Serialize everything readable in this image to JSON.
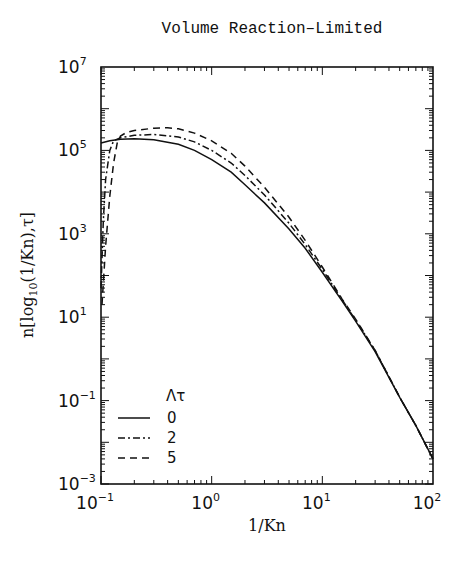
{
  "chart_data": {
    "type": "line",
    "title": "Volume Reaction–Limited",
    "xlabel": "1/Kn",
    "ylabel": "n[log10(1/Kn),τ]",
    "xscale": "log",
    "yscale": "log",
    "xlim": [
      0.1,
      100
    ],
    "ylim": [
      0.001,
      10000000
    ],
    "x_ticks": [
      {
        "base": "10",
        "exp": "−1",
        "value": 0.1
      },
      {
        "base": "10",
        "exp": "0",
        "value": 1
      },
      {
        "base": "10",
        "exp": "1",
        "value": 10
      },
      {
        "base": "10",
        "exp": "2",
        "value": 100
      }
    ],
    "y_ticks": [
      {
        "base": "10",
        "exp": "7",
        "value": 10000000
      },
      {
        "base": "10",
        "exp": "5",
        "value": 100000
      },
      {
        "base": "10",
        "exp": "3",
        "value": 1000
      },
      {
        "base": "10",
        "exp": "1",
        "value": 10
      },
      {
        "base": "10",
        "exp": "−1",
        "value": 0.1
      },
      {
        "base": "10",
        "exp": "−3",
        "value": 0.001
      }
    ],
    "grid": false,
    "legend": {
      "title": "Λτ",
      "position": "lower left",
      "entries": [
        {
          "label": "0",
          "style": "solid"
        },
        {
          "label": "2",
          "style": "dash-dot"
        },
        {
          "label": "5",
          "style": "dashed"
        }
      ]
    },
    "series": [
      {
        "name": "Λτ = 0",
        "style": "solid",
        "x": [
          0.1,
          0.12,
          0.15,
          0.2,
          0.3,
          0.5,
          0.7,
          1.0,
          1.5,
          2,
          3,
          5,
          7,
          10,
          15,
          20,
          30,
          50,
          70,
          100
        ],
        "y": [
          150000,
          170000,
          185000,
          190000,
          180000,
          140000,
          100000,
          60000,
          30000,
          15000,
          5500,
          1300,
          450,
          120,
          25,
          8,
          1.5,
          0.12,
          0.025,
          0.004
        ]
      },
      {
        "name": "Λτ = 2",
        "style": "dash-dot",
        "x": [
          0.1,
          0.105,
          0.11,
          0.12,
          0.13,
          0.15,
          0.2,
          0.3,
          0.5,
          0.7,
          1.0,
          1.5,
          2,
          3,
          5,
          7,
          10,
          15,
          20,
          30,
          50,
          70,
          100
        ],
        "y": [
          50,
          2000,
          20000,
          100000,
          170000,
          200000,
          230000,
          240000,
          210000,
          160000,
          100000,
          50000,
          25000,
          8500,
          1800,
          550,
          140,
          27,
          8.5,
          1.6,
          0.12,
          0.025,
          0.004
        ]
      },
      {
        "name": "Λτ = 5",
        "style": "dashed",
        "x": [
          0.102,
          0.11,
          0.12,
          0.13,
          0.14,
          0.15,
          0.17,
          0.2,
          0.3,
          0.4,
          0.5,
          0.7,
          1.0,
          1.5,
          2,
          3,
          5,
          7,
          10,
          15,
          20,
          30,
          50,
          70,
          100
        ],
        "y": [
          20,
          500,
          8000,
          50000,
          150000,
          220000,
          270000,
          300000,
          340000,
          350000,
          330000,
          260000,
          170000,
          85000,
          42000,
          13000,
          2500,
          700,
          160,
          28,
          9,
          1.6,
          0.12,
          0.025,
          0.004
        ]
      }
    ]
  }
}
